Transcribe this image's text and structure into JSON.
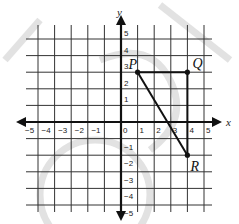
{
  "diagram": {
    "type": "coordinate-plane",
    "axes": {
      "x_label": "x",
      "y_label": "y",
      "x_ticks": [
        "-5",
        "-4",
        "-3",
        "-2",
        "-1",
        "0",
        "1",
        "2",
        "3",
        "4",
        "5"
      ],
      "y_ticks": [
        "5",
        "4",
        "3",
        "2",
        "1",
        "-1",
        "-2",
        "-3",
        "-4",
        "-5"
      ],
      "range": {
        "x": [
          -5,
          5
        ],
        "y": [
          -5,
          5
        ]
      }
    },
    "points": [
      {
        "name": "P",
        "x": 1,
        "y": 3
      },
      {
        "name": "Q",
        "x": 4,
        "y": 3
      },
      {
        "name": "R",
        "x": 4,
        "y": -2
      }
    ],
    "segments": [
      [
        "P",
        "Q"
      ],
      [
        "Q",
        "R"
      ],
      [
        "P",
        "R"
      ]
    ],
    "shape": "triangle PQR",
    "colors": {
      "grid": "#333333",
      "axis": "#111111",
      "line": "#111111",
      "watermark": "#d8d8d8"
    }
  }
}
